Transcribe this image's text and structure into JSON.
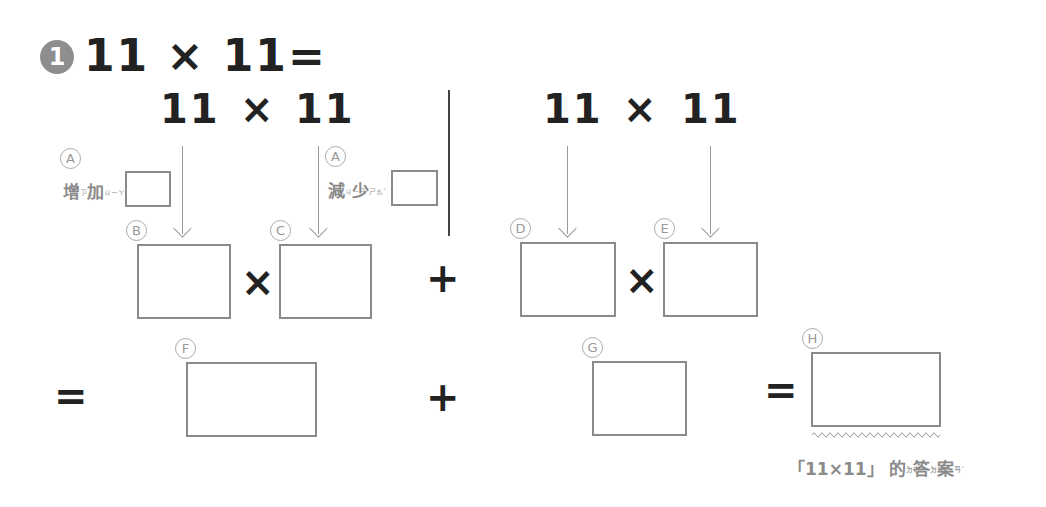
{
  "problem": {
    "number": "1",
    "title_expression": "11 × 11=",
    "left_expression": {
      "a": "11",
      "op": "×",
      "b": "11"
    },
    "right_expression": {
      "a": "11",
      "op": "×",
      "b": "11"
    }
  },
  "labels": {
    "A_left": "A",
    "A_right": "A",
    "B": "B",
    "C": "C",
    "D": "D",
    "E": "E",
    "F": "F",
    "G": "G",
    "H": "H"
  },
  "hints": {
    "increase": {
      "chars": [
        "增",
        "加"
      ],
      "ruby": [
        "ㄗㄥ",
        "ㄐㄧㄚ"
      ]
    },
    "decrease": {
      "chars": [
        "減",
        "少"
      ],
      "ruby": [
        "ㄐㄧㄢˇ",
        "ㄕㄠˇ"
      ]
    }
  },
  "operators": {
    "row1_left_times": "×",
    "row1_plus": "+",
    "row1_right_times": "×",
    "row2_equals": "=",
    "row2_plus": "+",
    "row2_equals_final": "="
  },
  "answer_caption": {
    "prefix": "「11×11」",
    "chars": [
      "的",
      "答",
      "案"
    ],
    "ruby": [
      "ㄉㄜ˙",
      "ㄉㄚˊ",
      "ㄢˋ"
    ]
  },
  "colors": {
    "text_dark": "#222222",
    "text_gray": "#8a8a8a",
    "box_border": "#8a8a8a",
    "badge": "#8e8e8e"
  }
}
